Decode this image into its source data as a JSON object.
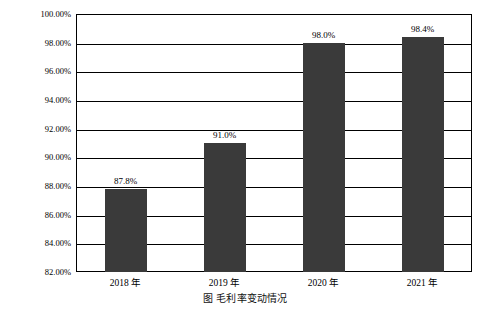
{
  "chart_data": {
    "type": "bar",
    "title": "",
    "xlabel": "",
    "ylabel": "",
    "categories": [
      "2018 年",
      "2019 年",
      "2020 年",
      "2021 年"
    ],
    "values": [
      87.8,
      91.0,
      98.0,
      98.4
    ],
    "data_labels": [
      "87.8%",
      "91.0%",
      "98.0%",
      "98.4%"
    ],
    "ylim": [
      82.0,
      100.0
    ],
    "ytick_values": [
      82.0,
      84.0,
      86.0,
      88.0,
      90.0,
      92.0,
      94.0,
      96.0,
      98.0,
      100.0
    ],
    "ytick_labels": [
      "82.00%",
      "84.00%",
      "86.00%",
      "88.00%",
      "90.00%",
      "92.00%",
      "94.00%",
      "96.00%",
      "98.00%",
      "100.00%"
    ],
    "grid": true,
    "legend": "none",
    "bar_color": "#3a3a3a",
    "frame_color": "#000000",
    "background_color": "#ffffff"
  },
  "caption": {
    "text": "图    毛利率变动情况"
  }
}
